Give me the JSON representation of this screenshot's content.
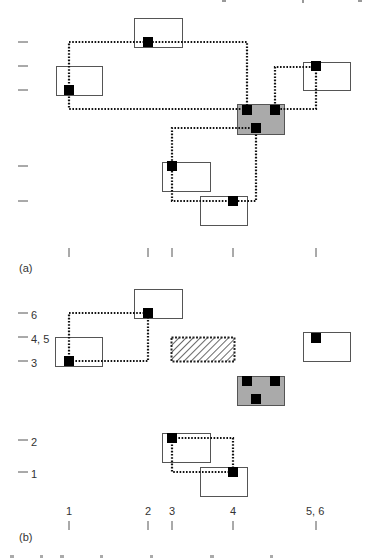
{
  "figure": {
    "panels": [
      {
        "id": "a",
        "label": "(a)",
        "y_ticks": [
          {
            "y": 42,
            "label": ""
          },
          {
            "y": 66,
            "label": ""
          },
          {
            "y": 90,
            "label": ""
          },
          {
            "y": 166,
            "label": ""
          },
          {
            "y": 201,
            "label": ""
          }
        ],
        "x_ticks": [
          {
            "x": 69,
            "label": ""
          },
          {
            "x": 148,
            "label": ""
          },
          {
            "x": 172,
            "label": ""
          },
          {
            "x": 233,
            "label": ""
          },
          {
            "x": 316,
            "label": ""
          }
        ],
        "boxes": [
          {
            "name": "box-top",
            "x": 134,
            "y": 18,
            "w": 48,
            "h": 29,
            "fill": "#ffffff",
            "style": "solid"
          },
          {
            "name": "box-left",
            "x": 56,
            "y": 66,
            "w": 46,
            "h": 29,
            "fill": "#ffffff",
            "style": "solid"
          },
          {
            "name": "box-right",
            "x": 303,
            "y": 62,
            "w": 47,
            "h": 28,
            "fill": "#ffffff",
            "style": "solid"
          },
          {
            "name": "box-gray",
            "x": 237,
            "y": 104,
            "w": 47,
            "h": 30,
            "fill": "#aaaaaa",
            "style": "solid"
          },
          {
            "name": "box-mid",
            "x": 162,
            "y": 162,
            "w": 48,
            "h": 29,
            "fill": "#ffffff",
            "style": "solid"
          },
          {
            "name": "box-bottom",
            "x": 200,
            "y": 196,
            "w": 47,
            "h": 29,
            "fill": "#ffffff",
            "style": "solid"
          }
        ],
        "nodes": [
          {
            "x": 148,
            "y": 42
          },
          {
            "x": 69,
            "y": 90
          },
          {
            "x": 316,
            "y": 66
          },
          {
            "x": 247,
            "y": 110
          },
          {
            "x": 275,
            "y": 110
          },
          {
            "x": 256,
            "y": 128
          },
          {
            "x": 172,
            "y": 166
          },
          {
            "x": 233,
            "y": 201
          }
        ],
        "wires": [
          "M69,90 L69,42 L247,42 L247,110",
          "M69,90 L69,109 L247,109",
          "M275,110 L275,67 L316,67 L316,109 L275,109",
          "M256,128 L172,128 L172,166",
          "M256,128 L256,201 L172,201 L172,166"
        ]
      },
      {
        "id": "b",
        "label": "(b)",
        "y_ticks": [
          {
            "y": 313,
            "label": "6"
          },
          {
            "y": 337,
            "label": "4, 5"
          },
          {
            "y": 361,
            "label": "3"
          },
          {
            "y": 440,
            "label": "2"
          },
          {
            "y": 472,
            "label": "1"
          }
        ],
        "x_ticks": [
          {
            "x": 69,
            "label": "1"
          },
          {
            "x": 148,
            "label": "2"
          },
          {
            "x": 172,
            "label": "3"
          },
          {
            "x": 233,
            "label": "4"
          },
          {
            "x": 316,
            "label": "5, 6"
          }
        ],
        "boxes": [
          {
            "name": "box-top",
            "x": 134,
            "y": 289,
            "w": 48,
            "h": 29,
            "fill": "#ffffff",
            "style": "solid"
          },
          {
            "name": "box-left",
            "x": 55,
            "y": 337,
            "w": 47,
            "h": 29,
            "fill": "#ffffff",
            "style": "solid"
          },
          {
            "name": "box-hatched",
            "x": 171,
            "y": 337,
            "w": 63,
            "h": 24,
            "fill": "hatch",
            "style": "dotted"
          },
          {
            "name": "box-right",
            "x": 303,
            "y": 332,
            "w": 47,
            "h": 29,
            "fill": "#ffffff",
            "style": "solid"
          },
          {
            "name": "box-gray",
            "x": 237,
            "y": 376,
            "w": 47,
            "h": 29,
            "fill": "#aaaaaa",
            "style": "solid"
          },
          {
            "name": "box-mid",
            "x": 162,
            "y": 433,
            "w": 48,
            "h": 29,
            "fill": "#ffffff",
            "style": "solid"
          },
          {
            "name": "box-bottom",
            "x": 200,
            "y": 467,
            "w": 47,
            "h": 29,
            "fill": "#ffffff",
            "style": "solid"
          }
        ],
        "nodes": [
          {
            "x": 148,
            "y": 313
          },
          {
            "x": 69,
            "y": 361
          },
          {
            "x": 316,
            "y": 338
          },
          {
            "x": 247,
            "y": 381
          },
          {
            "x": 275,
            "y": 381
          },
          {
            "x": 256,
            "y": 399
          },
          {
            "x": 172,
            "y": 438
          },
          {
            "x": 233,
            "y": 472
          }
        ],
        "wires": [
          "M69,361 L69,313 L148,313",
          "M69,361 L148,361 L148,313",
          "M172,438 L233,438 L233,472",
          "M172,438 L172,472 L233,472"
        ]
      }
    ],
    "colors": {
      "box_stroke": "#555555",
      "gray_fill": "#aaaaaa",
      "node": "#000000",
      "wire": "#111111",
      "tick": "#555555"
    }
  }
}
